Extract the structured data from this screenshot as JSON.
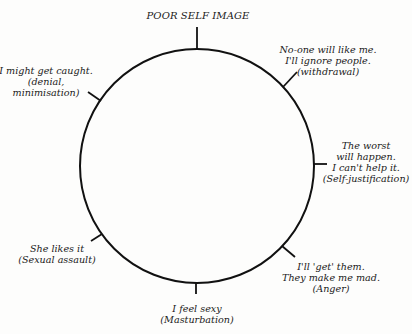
{
  "diagram": {
    "title": "POOR SELF IMAGE",
    "style": {
      "stroke": "#111111",
      "background": "#fdfdfc",
      "text": "#1a1a1a"
    },
    "circle": {
      "cx": 197,
      "cy": 166,
      "r": 117
    },
    "nodes": [
      {
        "id": "poor-self-image",
        "lines": [
          "POOR SELF IMAGE"
        ]
      },
      {
        "id": "withdrawal",
        "lines": [
          "No-one will like me.",
          "I'll ignore people.",
          "(withdrawal)"
        ]
      },
      {
        "id": "self-justification",
        "lines": [
          "The worst",
          "will happen.",
          "I can't help it.",
          "(Self-justification)"
        ]
      },
      {
        "id": "anger",
        "lines": [
          "I'll 'get' them.",
          "They make me mad.",
          "(Anger)"
        ]
      },
      {
        "id": "masturbation",
        "lines": [
          "I feel sexy",
          "(Masturbation)"
        ]
      },
      {
        "id": "sexual-assault",
        "lines": [
          "She likes it",
          "(Sexual assault)"
        ]
      },
      {
        "id": "denial",
        "lines": [
          "I might get caught.",
          "(denial,",
          "minimisation)"
        ]
      }
    ]
  }
}
